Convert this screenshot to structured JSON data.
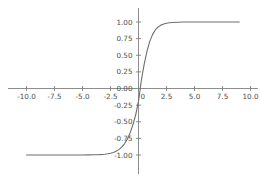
{
  "chart_data": {
    "type": "line",
    "title": "",
    "subtitle": "",
    "xlabel": "",
    "ylabel": "",
    "grid": false,
    "legend": null,
    "legend_position": "none",
    "xlim": [
      -11.6,
      10.9
    ],
    "ylim": [
      -1.12,
      1.12
    ],
    "xticks": [
      -10.0,
      -7.5,
      -5.0,
      -2.5,
      0.0,
      2.5,
      5.0,
      7.5,
      10.0
    ],
    "xtick_labels": [
      "-10.0",
      "-7.5",
      "-5.0",
      "-2.5",
      "0",
      "2.5",
      "5.0",
      "7.5",
      "10.0"
    ],
    "yticks": [
      1.0,
      0.75,
      0.5,
      0.25,
      0.0,
      -0.25,
      -0.5,
      -0.75,
      -1.0
    ],
    "ytick_labels": [
      "1.00",
      "0.75",
      "0.50",
      "0.25",
      "0.00",
      "-0.25",
      "-0.50",
      "-0.75",
      "-1.00"
    ],
    "spine_style": "centered-at-origin",
    "series": [
      {
        "name": "tanh-like sigmoid",
        "color": "#6e6e6e",
        "x": [
          -10.0,
          -9.5,
          -9.0,
          -8.5,
          -8.0,
          -7.5,
          -7.0,
          -6.5,
          -6.0,
          -5.5,
          -5.0,
          -4.5,
          -4.0,
          -3.5,
          -3.0,
          -2.75,
          -2.5,
          -2.25,
          -2.0,
          -1.75,
          -1.5,
          -1.25,
          -1.0,
          -0.75,
          -0.5,
          -0.25,
          -0.1,
          0.0,
          0.1,
          0.25,
          0.5,
          0.75,
          1.0,
          1.25,
          1.5,
          1.75,
          2.0,
          2.25,
          2.5,
          2.75,
          3.0,
          3.5,
          4.0,
          4.5,
          5.0,
          5.5,
          6.0,
          6.5,
          7.0,
          7.5,
          8.0,
          8.5,
          9.0
        ],
        "y": [
          -1.0,
          -1.0,
          -1.0,
          -1.0,
          -1.0,
          -1.0,
          -1.0,
          -1.0,
          -0.999,
          -0.999,
          -0.999,
          -0.998,
          -0.997,
          -0.994,
          -0.988,
          -0.982,
          -0.974,
          -0.962,
          -0.944,
          -0.919,
          -0.882,
          -0.832,
          -0.762,
          -0.668,
          -0.546,
          -0.395,
          -0.271,
          -0.19,
          -0.075,
          0.12,
          0.36,
          0.555,
          0.705,
          0.81,
          0.88,
          0.925,
          0.953,
          0.971,
          0.982,
          0.989,
          0.993,
          0.997,
          0.999,
          0.999,
          1.0,
          1.0,
          1.0,
          1.0,
          1.0,
          1.0,
          1.0,
          1.0,
          1.0
        ]
      }
    ]
  },
  "figure": {
    "background_color": "#ffffff",
    "axis_color": "#808080",
    "tick_label_color": "#4d4d4d"
  }
}
